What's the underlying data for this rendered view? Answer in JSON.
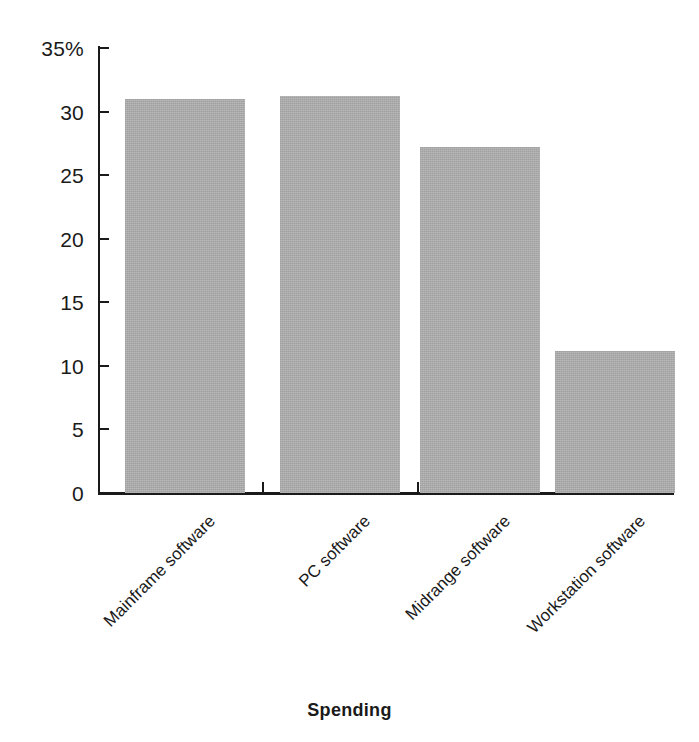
{
  "chart_data": {
    "type": "bar",
    "title": "",
    "xlabel": "Spending",
    "ylabel": "",
    "categories": [
      "Mainframe software",
      "PC software",
      "Midrange software",
      "Workstation software"
    ],
    "values": [
      31.0,
      31.2,
      27.2,
      11.2
    ],
    "ylim": [
      0,
      35
    ],
    "ytick_values": [
      0,
      5,
      10,
      15,
      20,
      25,
      30,
      35
    ],
    "ytick_labels": [
      "0",
      "5",
      "10",
      "15",
      "20",
      "25",
      "30",
      "35%"
    ],
    "grid": false,
    "legend": null,
    "bar_color": "#a9a9a9",
    "axis_color": "#1a1a1a",
    "background": "#ffffff",
    "label_rotation_deg": -45
  },
  "axis": {
    "x_title": "Spending"
  }
}
